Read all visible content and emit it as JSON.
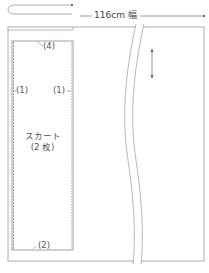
{
  "diagram": {
    "fabric_width_label": "116cm 幅",
    "piece": {
      "name": "スカート",
      "count": "(2 枚)"
    },
    "seam_allowances": {
      "top": "(4)",
      "left": "(1)",
      "right": "(1)",
      "bottom": "(2)"
    },
    "colors": {
      "line": "#9a9a9a",
      "dark_line": "#555555",
      "text": "#555555",
      "background": "#ffffff"
    }
  }
}
